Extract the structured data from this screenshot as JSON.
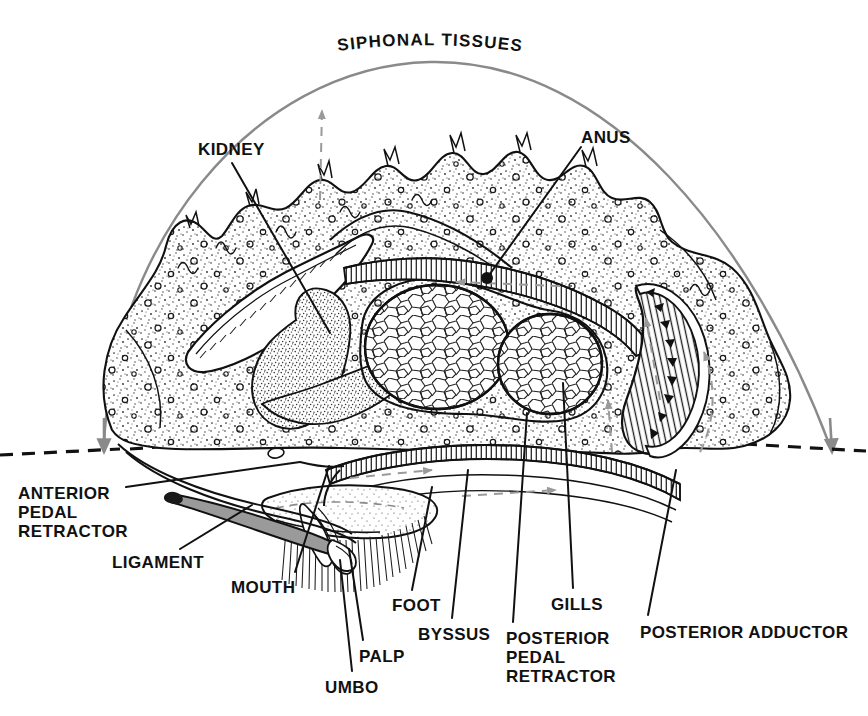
{
  "figure": {
    "style": "black-and-white stipple line engraving",
    "background_color": "#ffffff",
    "ink_color": "#111111",
    "accent_gray": "#8a8a8a",
    "ligament_fill": "#9a9a9a"
  },
  "arc_label": {
    "text": "SIPHONAL TISSUES",
    "letters": [
      "S",
      "I",
      "P",
      "H",
      "O",
      "N",
      "A",
      "L",
      " ",
      "T",
      "I",
      "S",
      "S",
      "U",
      "E",
      "S"
    ],
    "color": "#111111",
    "font_size": 17
  },
  "labels": [
    {
      "id": "kidney",
      "lines": [
        "KIDNEY"
      ],
      "x": 198,
      "y": 140,
      "align": "left"
    },
    {
      "id": "anus",
      "lines": [
        "ANUS"
      ],
      "x": 581,
      "y": 128,
      "align": "left"
    },
    {
      "id": "anterior-pedal-retractor",
      "lines": [
        "ANTERIOR",
        "PEDAL",
        "RETRACTOR"
      ],
      "x": 18,
      "y": 484,
      "align": "left"
    },
    {
      "id": "ligament",
      "lines": [
        "LIGAMENT"
      ],
      "x": 112,
      "y": 553,
      "align": "left"
    },
    {
      "id": "mouth",
      "lines": [
        "MOUTH"
      ],
      "x": 231,
      "y": 578,
      "align": "left"
    },
    {
      "id": "foot",
      "lines": [
        "FOOT"
      ],
      "x": 392,
      "y": 596,
      "align": "left"
    },
    {
      "id": "byssus",
      "lines": [
        "BYSSUS"
      ],
      "x": 418,
      "y": 625,
      "align": "left"
    },
    {
      "id": "palp",
      "lines": [
        "PALP"
      ],
      "x": 359,
      "y": 647,
      "align": "left"
    },
    {
      "id": "umbo",
      "lines": [
        "UMBO"
      ],
      "x": 325,
      "y": 678,
      "align": "left"
    },
    {
      "id": "gills",
      "lines": [
        "GILLS"
      ],
      "x": 551,
      "y": 595,
      "align": "left"
    },
    {
      "id": "posterior-pedal-retractor",
      "lines": [
        "POSTERIOR",
        "PEDAL",
        "RETRACTOR"
      ],
      "x": 506,
      "y": 629,
      "align": "left"
    },
    {
      "id": "posterior-adductor",
      "lines": [
        "POSTERIOR ADDUCTOR"
      ],
      "x": 640,
      "y": 623,
      "align": "left"
    }
  ],
  "leaders": [
    {
      "id": "kidney-leader",
      "from": [
        232,
        163
      ],
      "to": [
        330,
        333
      ]
    },
    {
      "id": "anus-leader",
      "from": [
        581,
        147
      ],
      "to": [
        487,
        278
      ]
    },
    {
      "id": "apr-leader",
      "from": [
        126,
        487
      ],
      "to": [
        300,
        462
      ]
    },
    {
      "id": "ligament-leader",
      "from": [
        180,
        549
      ],
      "to": [
        252,
        505
      ]
    },
    {
      "id": "mouth-leader",
      "from": [
        295,
        572
      ],
      "to": [
        329,
        466
      ]
    },
    {
      "id": "foot-leader",
      "from": [
        412,
        590
      ],
      "to": [
        432,
        487
      ]
    },
    {
      "id": "byssus-leader",
      "from": [
        452,
        618
      ],
      "to": [
        468,
        470
      ]
    },
    {
      "id": "palp-leader",
      "from": [
        363,
        640
      ],
      "to": [
        349,
        549
      ]
    },
    {
      "id": "umbo-leader",
      "from": [
        352,
        671
      ],
      "to": [
        340,
        560
      ]
    },
    {
      "id": "gills-leader",
      "from": [
        573,
        588
      ],
      "to": [
        563,
        383
      ]
    },
    {
      "id": "ppr-leader",
      "from": [
        513,
        622
      ],
      "to": [
        527,
        413
      ]
    },
    {
      "id": "pa-leader",
      "from": [
        648,
        615
      ],
      "to": [
        676,
        470
      ]
    }
  ],
  "siphonal_arc": {
    "color": "#8a8a8a",
    "stroke_width": 2.4,
    "left_arrow_tip": [
      98,
      452
    ],
    "right_arrow_tip": [
      836,
      452
    ],
    "apex": [
      430,
      62
    ]
  },
  "baseline_dashes": {
    "color": "#111111",
    "left_segment": [
      0,
      452,
      225,
      440
    ],
    "right_segment": [
      735,
      443,
      868,
      448
    ],
    "dash_pattern": "12 8"
  },
  "organs": [
    {
      "id": "siphon-mantle-mass",
      "name": "siphonal / mantle tissue mass",
      "texture": "stipple-with-pores"
    },
    {
      "id": "kidney-organ",
      "name": "kidney",
      "texture": "dense-stipple"
    },
    {
      "id": "gonad-left",
      "name": "gonad / digestive mass (anterior)",
      "texture": "reticulate-cells"
    },
    {
      "id": "gonad-right",
      "name": "gonad / digestive mass (posterior)",
      "texture": "reticulate-cells"
    },
    {
      "id": "gill-lamella-upper",
      "name": "upper gill lamella",
      "texture": "fine-comb-hatch"
    },
    {
      "id": "gill-lamella-lower",
      "name": "lower gill lamella",
      "texture": "fine-comb-hatch"
    },
    {
      "id": "posterior-adductor-muscle",
      "name": "posterior adductor muscle",
      "texture": "radial-hatch"
    },
    {
      "id": "foot-organ",
      "name": "foot",
      "texture": "light-stipple"
    },
    {
      "id": "byssus-threads",
      "name": "byssus threads",
      "texture": "fine-parallel-lines"
    },
    {
      "id": "ligament-organ",
      "name": "ligament",
      "texture": "solid-gray"
    },
    {
      "id": "palp-organ",
      "name": "labial palp",
      "texture": "arc-hatch"
    }
  ],
  "flow_arrows": {
    "color": "#9a9a9a",
    "count": 6,
    "description": "dashed gray water-current arrows inside mantle cavity"
  }
}
